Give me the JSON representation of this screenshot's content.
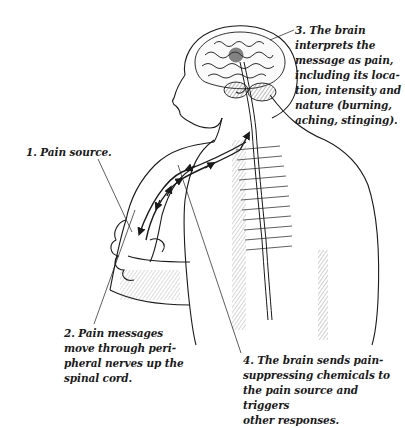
{
  "diagram": {
    "type": "anatomical-illustration",
    "labels": [
      {
        "id": "1",
        "text": "1. Pain source."
      },
      {
        "id": "2",
        "text": "2. Pain messages\nmove through peri-\npheral nerves up the\nspinal cord."
      },
      {
        "id": "3",
        "text": "3. The brain\ninterprets the\nmessage as pain,\nincluding its loca-\ntion, intensity and\nnature (burning,\naching, stinging)."
      },
      {
        "id": "4",
        "text": "4. The brain sends pain-\nsuppressing chemicals to\nthe pain source and triggers\nother responses."
      }
    ],
    "colors": {
      "ink": "#1a1a1a",
      "background": "#ffffff",
      "hatch": "#555555"
    }
  }
}
